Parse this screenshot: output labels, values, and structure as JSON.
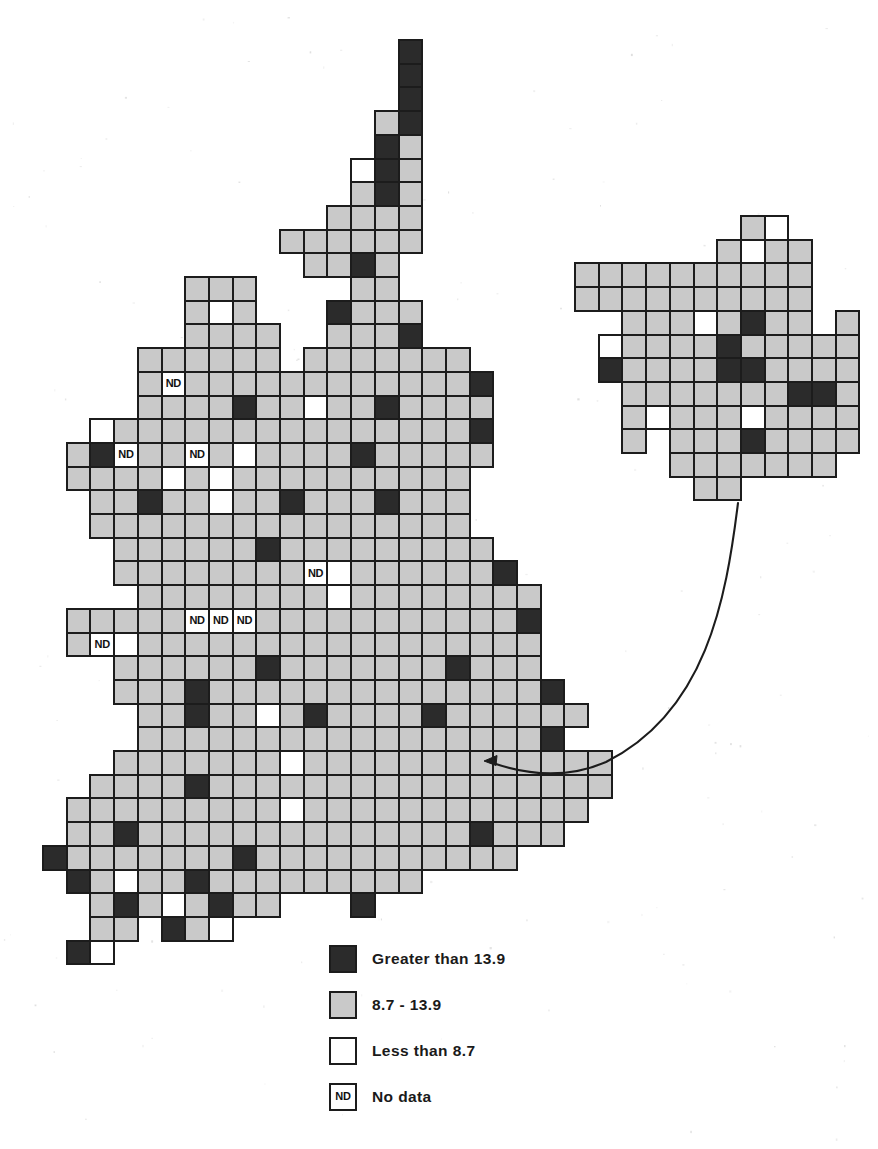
{
  "figure": {
    "kind": "choropleth-grid-map",
    "region": "United Kingdom and Ireland",
    "background_color": "#ffffff"
  },
  "palette": {
    "high": "#2b2b2b",
    "mid": "#c9c9c9",
    "low": "#ffffff",
    "no_data_fill": "#ffffff",
    "border": "#1c1c1c",
    "text": "#1a1a1a"
  },
  "geometry": {
    "cell_size": 23.7,
    "main_origin_x": 43.0,
    "main_origin_y": 40.0,
    "inset_origin_x": 575.0,
    "inset_origin_y": 216.0
  },
  "chart_data": {
    "type": "heatmap",
    "title": "",
    "xlabel": "",
    "ylabel": "",
    "classes": [
      {
        "key": "high",
        "label": "Greater than 13.9",
        "color": "#2b2b2b"
      },
      {
        "key": "mid",
        "label": "8.7 - 13.9",
        "color": "#c9c9c9"
      },
      {
        "key": "low",
        "label": "Less than 8.7",
        "color": "#ffffff"
      },
      {
        "key": "nd",
        "label": "No data",
        "color": "#ffffff"
      }
    ],
    "value_breaks": [
      8.7,
      13.9
    ],
    "main_map": {
      "name": "Great Britain",
      "cols": 25,
      "rows": 39,
      "rows_data": [
        "...............h.........",
        "...............h.........",
        "...............h.........",
        "..............mh.........",
        "..............hm.........",
        ".............lhm.........",
        ".............mhm.........",
        "............mmmm.........",
        "..........mmmmmm.........",
        "...........mmhm..........",
        "......mmm....mm..........",
        "......mlm...hmmm.........",
        "......mmmm..mmmh.........",
        "....mmmmmm.mmmmmmm.......",
        "....mNmmmmmmmmmmmmh......",
        "....mmmmhmmlmmhmmmm......",
        "..lmmmmmmmmmmmmmmmh......",
        ".mhNmmNmlmmmmhmmmmm......",
        ".mmmmlmlmmmmmmmmmm.......",
        "..mmhmmlmmhmmmhmmm.......",
        "..mmmmmmmmmmmmmmmm.......",
        "...mmmmmmhmmmmmmmmm......",
        "...mmmmmmmmNlmmmmmmh.....",
        "....mmmmmmmmlmmmmmmmm....",
        ".mmmmmNNNmmmmmmmmmmmh....",
        ".mmNmmmmmmmmmmmmmmmmm....",
        "...mmmmmmhmmmmmmmhmmm....",
        "...mmmhmmmmmmmmmmmmmmh...",
        "....mmhmmlmhmmmmhmmmmmm..",
        "....mmmmmmmmmmmmmmmmmh...",
        "...mmmmmmmlmmmmmmmmmmmmm.",
        "..mmmmhmmmmmmmmmmmmmmmmm.",
        ".mmmmmmmmmlmmmmmmmmmmmm..",
        ".mmhmmmmmmmmmmmmmmhmmm...",
        "hmmmmmmmhmmmmmmmmmmm.....",
        ".hmlmmhmmmmmmmmm.........",
        "..mhmlmhmm...h...........",
        "..mm.hml.................",
        ".hl......................"
      ]
    },
    "inset_map": {
      "name": "Ireland",
      "cols": 12,
      "rows": 12,
      "rows_data": [
        ".......ml...",
        "......mlmm..",
        "mmmmmmmmmm..",
        "mmmmmmmmmm..",
        "..mmmlmhmm.m",
        ".lmmmmhmmmmm",
        ".hmmmmhhmmmm",
        "..mmmmmmmhhm",
        "..mlmmmlmmmm",
        "..m.mmmhmmmm",
        "....mmmmmmm.",
        ".....mm....."
      ]
    },
    "no_data_cells": {
      "main": [
        {
          "col": 5,
          "row": 14,
          "label": "ND"
        },
        {
          "col": 3,
          "row": 17,
          "label": "ND"
        },
        {
          "col": 6,
          "row": 17,
          "label": "ND"
        },
        {
          "col": 11,
          "row": 22,
          "label": "ND"
        },
        {
          "col": 6,
          "row": 24,
          "label": "ND"
        },
        {
          "col": 7,
          "row": 24,
          "label": "ND"
        },
        {
          "col": 8,
          "row": 24,
          "label": "ND"
        },
        {
          "col": 2,
          "row": 25,
          "label": "ND"
        }
      ],
      "inset": []
    }
  },
  "pointer": {
    "name": "inset-callout-arrow",
    "path": "M 738 503 C 726 600, 706 712, 606 762 C 560 782, 518 772, 490 762",
    "arrow_tip_x": 484,
    "arrow_tip_y": 761
  },
  "legend": {
    "name": "map-legend",
    "x": 330,
    "swatch_size": 26,
    "label_x": 372,
    "entries": [
      {
        "key": "high",
        "label": "Greater than 13.9",
        "fill": "#2b2b2b",
        "y": 946,
        "nd": false
      },
      {
        "key": "mid",
        "label": "8.7 - 13.9",
        "fill": "#c9c9c9",
        "y": 992,
        "nd": false
      },
      {
        "key": "low",
        "label": "Less than 8.7",
        "fill": "#ffffff",
        "y": 1038,
        "nd": false
      },
      {
        "key": "nd",
        "label": "No data",
        "fill": "#ffffff",
        "y": 1084,
        "nd": true,
        "badge": "ND"
      }
    ]
  }
}
